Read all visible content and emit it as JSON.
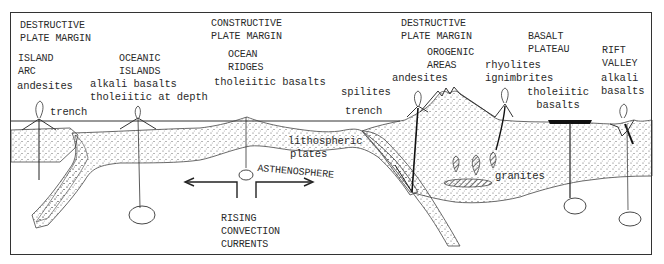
{
  "diagram": {
    "colors": {
      "line": "#333333",
      "stipple": "#555555",
      "background": "#ffffff",
      "basalt_flow": "#111111"
    },
    "margins": [
      {
        "id": "destructive-left",
        "line1": "DESTRUCTIVE",
        "line2": "PLATE MARGIN"
      },
      {
        "id": "constructive",
        "line1": "CONSTRUCTIVE",
        "line2": "PLATE MARGIN"
      },
      {
        "id": "destructive-right",
        "line1": "DESTRUCTIVE",
        "line2": "PLATE MARGIN"
      }
    ],
    "settings": [
      {
        "id": "island-arc",
        "line1": "ISLAND",
        "line2": "ARC",
        "rocks": [
          "andesites"
        ]
      },
      {
        "id": "oceanic-islands",
        "line1": "OCEANIC",
        "line2": "ISLANDS",
        "rocks": [
          "alkali basalts",
          "tholeiitic at depth"
        ]
      },
      {
        "id": "ocean-ridges",
        "line1": "OCEAN",
        "line2": "RIDGES",
        "rocks": [
          "tholeiitic basalts"
        ]
      },
      {
        "id": "orogenic-areas",
        "line1": "OROGENIC",
        "line2": "AREAS",
        "rocks": [
          "andesites"
        ]
      },
      {
        "id": "basalt-plateau",
        "line1": "BASALT",
        "line2": "PLATEAU",
        "rocks": [
          "tholeiitic",
          "basalts"
        ]
      },
      {
        "id": "rift-valley",
        "line1": "RIFT",
        "line2": "VALLEY",
        "rocks": [
          "alkali",
          "basalts"
        ]
      }
    ],
    "extra_rocks": {
      "rhyolites": "rhyolites",
      "ignimbrites": "ignimbrites",
      "spilites": "spilites",
      "granites": "granites"
    },
    "features": {
      "trench_left": "trench",
      "trench_right": "trench",
      "lithospheric_1": "lithospheric",
      "lithospheric_2": "plates",
      "asthenosphere": "ASTHENOSPHERE",
      "convection_1": "RISING",
      "convection_2": "CONVECTION",
      "convection_3": "CURRENTS"
    }
  }
}
